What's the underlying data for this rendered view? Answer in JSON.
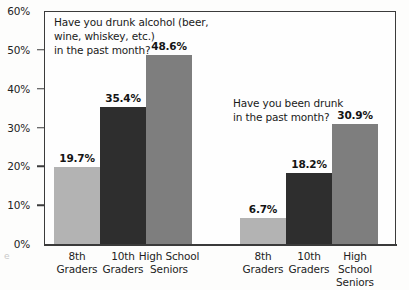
{
  "chart_data": {
    "type": "bar",
    "title": "",
    "subtitle": "",
    "xlabel": "",
    "ylabel": "",
    "ylim": [
      0,
      60
    ],
    "y_unit": "%",
    "grid": false,
    "legend": "none",
    "y_ticks": [
      {
        "value": 60,
        "label": "60%"
      },
      {
        "value": 50,
        "label": "50%"
      },
      {
        "value": 40,
        "label": "40%"
      },
      {
        "value": 30,
        "label": "30%"
      },
      {
        "value": 20,
        "label": "20%"
      },
      {
        "value": 10,
        "label": "10%"
      },
      {
        "value": 0,
        "label": "0%"
      }
    ],
    "categories": [
      "8th\nGraders",
      "10th\nGraders",
      "High School\nSeniors"
    ],
    "groups": [
      {
        "question": "Have you drunk alcohol (beer,\nwine, whiskey, etc.)\nin the past month?",
        "bars": [
          {
            "category": "8th\nGraders",
            "value": 19.7,
            "label": "19.7%",
            "shade": "light"
          },
          {
            "category": "10th\nGraders",
            "value": 35.4,
            "label": "35.4%",
            "shade": "dark"
          },
          {
            "category": "High School\nSeniors",
            "value": 48.6,
            "label": "48.6%",
            "shade": "medium"
          }
        ]
      },
      {
        "question": "Have you been drunk\nin the past month?",
        "bars": [
          {
            "category": "8th\nGraders",
            "value": 6.7,
            "label": "6.7%",
            "shade": "light"
          },
          {
            "category": "10th\nGraders",
            "value": 18.2,
            "label": "18.2%",
            "shade": "dark"
          },
          {
            "category": "High School\nSeniors",
            "value": 30.9,
            "label": "30.9%",
            "shade": "medium"
          }
        ]
      }
    ],
    "colors": {
      "light": "#b3b3b3",
      "dark": "#2e2e2e",
      "medium": "#7e7e7e",
      "axis": "#3b3b3b",
      "text": "#1a1a1a",
      "plot_background": "#fefefe"
    }
  },
  "artifact": {
    "mark": "e"
  }
}
